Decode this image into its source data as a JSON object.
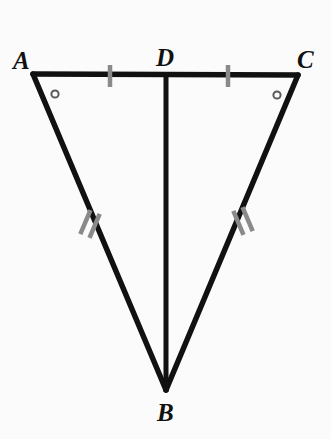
{
  "figure": {
    "background_color": "#fbfbfb",
    "stroke_color": "#111111",
    "tick_color": "#8a8a8a",
    "marker_color": "#5a5a5a",
    "stroke_width": 5,
    "labels": {
      "a": "A",
      "b": "B",
      "c": "C",
      "d": "D"
    },
    "vertices": {
      "A": {
        "x": 33,
        "y": 74
      },
      "B": {
        "x": 166,
        "y": 390
      },
      "C": {
        "x": 298,
        "y": 75
      },
      "D": {
        "x": 166,
        "y": 77
      }
    },
    "segments": [
      {
        "name": "AC",
        "from": "A",
        "to": "C",
        "style": "solid"
      },
      {
        "name": "AB",
        "from": "A",
        "to": "B",
        "style": "solid"
      },
      {
        "name": "CB",
        "from": "C",
        "to": "B",
        "style": "solid"
      },
      {
        "name": "DB",
        "from": "D",
        "to": "B",
        "style": "solid"
      }
    ],
    "congruence_marks": [
      {
        "name": "tick-AD",
        "segment": "AD",
        "count": 1,
        "center": {
          "x": 110,
          "y": 76
        },
        "angle_deg": 90,
        "length": 22
      },
      {
        "name": "tick-DC",
        "segment": "DC",
        "count": 1,
        "center": {
          "x": 228,
          "y": 76
        },
        "angle_deg": 90,
        "length": 22
      },
      {
        "name": "tick-AB",
        "segment": "AB",
        "count": 2,
        "center": {
          "x": 90,
          "y": 224
        },
        "angle_deg": 113,
        "length": 26,
        "spacing": 9
      },
      {
        "name": "tick-CB",
        "segment": "CB",
        "count": 2,
        "center": {
          "x": 243,
          "y": 221
        },
        "angle_deg": 67,
        "length": 26,
        "spacing": 9
      }
    ],
    "angle_markers": [
      {
        "name": "angle-A",
        "vertex": "A",
        "x": 55,
        "y": 94,
        "radius": 4,
        "shape": "circle"
      },
      {
        "name": "angle-C",
        "vertex": "C",
        "x": 277,
        "y": 95,
        "radius": 4,
        "shape": "circle"
      }
    ]
  }
}
